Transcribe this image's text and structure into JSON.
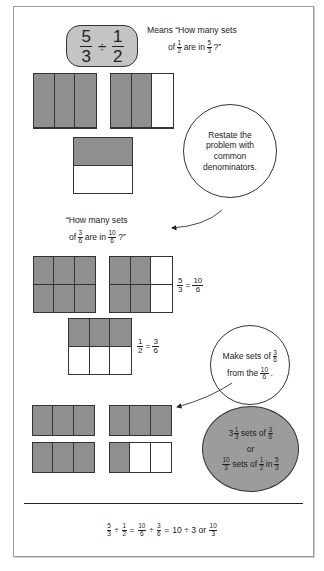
{
  "problem": {
    "dividend": {
      "num": "5",
      "den": "3"
    },
    "operator": "÷",
    "divisor": {
      "num": "1",
      "den": "2"
    }
  },
  "meaning": {
    "line1": "Means “How many sets",
    "line2_prefix": "of",
    "frac_a": {
      "num": "1",
      "den": "2"
    },
    "line2_mid": "are in",
    "frac_b": {
      "num": "5",
      "den": "3"
    },
    "line2_suffix": "?”"
  },
  "callout_restate": {
    "lines": [
      "Restate the",
      "problem with",
      "common",
      "denominators."
    ]
  },
  "restated_question": {
    "line1": "“How many sets",
    "line2_prefix": "of",
    "frac_a": {
      "num": "3",
      "den": "6"
    },
    "line2_mid": "are in",
    "frac_b": {
      "num": "10",
      "den": "6"
    },
    "line2_suffix": "?”"
  },
  "equivalence_labels": {
    "five_thirds": {
      "left": {
        "num": "5",
        "den": "3"
      },
      "eq": "=",
      "right": {
        "num": "10",
        "den": "6"
      }
    },
    "one_half": {
      "left": {
        "num": "1",
        "den": "2"
      },
      "eq": "=",
      "right": {
        "num": "3",
        "den": "6"
      }
    }
  },
  "callout_make_sets": {
    "line1_prefix": "Make sets of",
    "frac_a": {
      "num": "3",
      "den": "6"
    },
    "line2_prefix": "from the",
    "frac_b": {
      "num": "10",
      "den": "6"
    },
    "line2_suffix": "."
  },
  "result_ellipse": {
    "line1_whole": "3",
    "line1_frac": {
      "num": "1",
      "den": "3"
    },
    "line1_mid": "sets of",
    "line1_frac2": {
      "num": "3",
      "den": "6"
    },
    "line2": "or",
    "line3_frac": {
      "num": "10",
      "den": "3"
    },
    "line3_mid": "sets of",
    "line3_frac2": {
      "num": "1",
      "den": "2"
    },
    "line3_in": "in",
    "line3_frac3": {
      "num": "5",
      "den": "3"
    }
  },
  "final_equation": {
    "f1": {
      "num": "5",
      "den": "3"
    },
    "op1": "÷",
    "f2": {
      "num": "1",
      "den": "2"
    },
    "eq1": "=",
    "f3": {
      "num": "10",
      "den": "6"
    },
    "op2": "÷",
    "f4": {
      "num": "3",
      "den": "6"
    },
    "eq2": "=",
    "expr": "10 ÷ 3 or",
    "f5": {
      "num": "10",
      "den": "3"
    }
  },
  "models": {
    "row1_left": {
      "cols": 3,
      "rows": 1,
      "shaded": [
        1,
        1,
        1
      ]
    },
    "row1_right": {
      "cols": 3,
      "rows": 1,
      "shaded": [
        1,
        1,
        0
      ]
    },
    "half": {
      "cols": 1,
      "rows": 2,
      "shaded": [
        1,
        0
      ]
    },
    "row2_left": {
      "cols": 3,
      "rows": 2,
      "shaded": [
        1,
        1,
        1,
        1,
        1,
        1
      ]
    },
    "row2_right": {
      "cols": 3,
      "rows": 2,
      "shaded": [
        1,
        1,
        0,
        1,
        1,
        0
      ]
    },
    "three_sixths": {
      "cols": 3,
      "rows": 2,
      "shaded": [
        1,
        1,
        1,
        0,
        0,
        0
      ]
    },
    "sets": [
      {
        "cols": 3,
        "rows": 1,
        "shaded": [
          1,
          1,
          1
        ]
      },
      {
        "cols": 3,
        "rows": 1,
        "shaded": [
          1,
          1,
          1
        ]
      },
      {
        "cols": 3,
        "rows": 1,
        "shaded": [
          1,
          1,
          1
        ]
      },
      {
        "cols": 3,
        "rows": 1,
        "shaded": [
          1,
          0,
          0
        ]
      }
    ]
  },
  "colors": {
    "shade": "#8f8f8f",
    "box_fill": "#c4c4c4",
    "ellipse_fill": "#9c9c9c",
    "stroke": "#333333"
  }
}
